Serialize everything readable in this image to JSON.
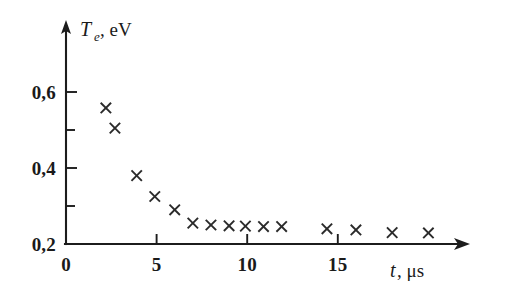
{
  "figure": {
    "background_color": "#ffffff",
    "ink_color": "#1a1a1a",
    "marker_symbol": "x"
  },
  "chart_data": {
    "type": "scatter",
    "title": "",
    "xlabel": "t, μs",
    "ylabel": "T_e, eV",
    "ylabel_parts": {
      "symbol": "T",
      "subscript": "e",
      "unit": ", eV"
    },
    "xlabel_parts": {
      "symbol": "t",
      "unit": ", μs"
    },
    "xlim": [
      0,
      21.5
    ],
    "ylim": [
      0.13,
      0.655
    ],
    "grid": false,
    "legend": null,
    "x_ticks_major": [
      0,
      5,
      10,
      15
    ],
    "x_tick_labels": [
      "0",
      "5",
      "10",
      "15"
    ],
    "y_ticks_major": [
      0.2,
      0.4,
      0.6
    ],
    "y_tick_labels": [
      "0,2",
      "0,4",
      "0,6"
    ],
    "y_ticks_minor": [
      0.3,
      0.5
    ],
    "decimal_separator": ",",
    "x": [
      2.2,
      2.7,
      3.9,
      4.9,
      6.0,
      7.0,
      8.0,
      9.0,
      9.9,
      10.9,
      11.9,
      14.4,
      16.0,
      18.0,
      20.0
    ],
    "y": [
      0.558,
      0.505,
      0.38,
      0.325,
      0.29,
      0.255,
      0.25,
      0.248,
      0.247,
      0.246,
      0.246,
      0.24,
      0.237,
      0.23,
      0.229
    ],
    "points": [
      {
        "t": 2.2,
        "Te": 0.558
      },
      {
        "t": 2.7,
        "Te": 0.505
      },
      {
        "t": 3.9,
        "Te": 0.38
      },
      {
        "t": 4.9,
        "Te": 0.325
      },
      {
        "t": 6.0,
        "Te": 0.29
      },
      {
        "t": 7.0,
        "Te": 0.255
      },
      {
        "t": 8.0,
        "Te": 0.25
      },
      {
        "t": 9.0,
        "Te": 0.248
      },
      {
        "t": 9.9,
        "Te": 0.247
      },
      {
        "t": 10.9,
        "Te": 0.246
      },
      {
        "t": 11.9,
        "Te": 0.246
      },
      {
        "t": 14.4,
        "Te": 0.24
      },
      {
        "t": 16.0,
        "Te": 0.237
      },
      {
        "t": 18.0,
        "Te": 0.23
      },
      {
        "t": 20.0,
        "Te": 0.229
      }
    ]
  },
  "geometry": {
    "origin_px": {
      "x": 66,
      "y": 244
    },
    "x_px_per_unit": 18.12,
    "y_px_per_unit": 380.0,
    "x_axis_end_px": 468,
    "y_axis_top_px": 22,
    "marker_half_px": 5.2
  }
}
